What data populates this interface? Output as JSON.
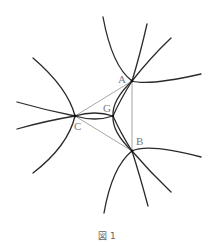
{
  "figure": {
    "caption": "図 1",
    "points": {
      "A": {
        "label": "A",
        "x": 132,
        "y": 81
      },
      "B": {
        "label": "B",
        "x": 132,
        "y": 151
      },
      "C": {
        "label": "C",
        "x": 75,
        "y": 116
      },
      "G": {
        "label": "G",
        "x": 113,
        "y": 116
      }
    },
    "colors": {
      "curve": "#2a2a2a",
      "triangle": "#6a6a6a",
      "label": "#7a7a7a"
    }
  }
}
